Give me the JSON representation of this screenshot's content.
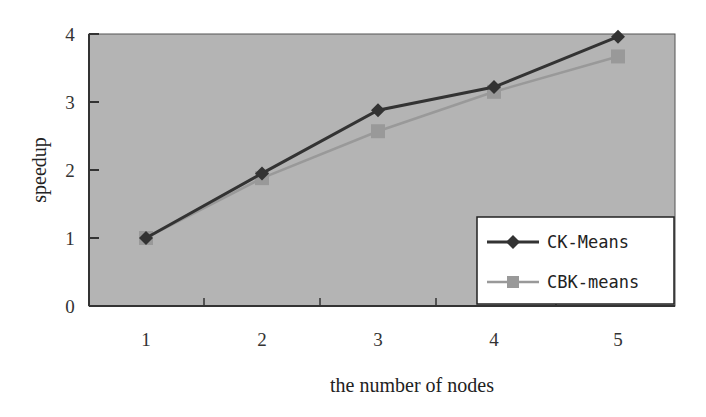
{
  "chart_data": {
    "type": "line",
    "title": "",
    "xlabel": "the number of nodes",
    "ylabel": "speedup",
    "categories": [
      "1",
      "2",
      "3",
      "4",
      "5"
    ],
    "x": [
      1,
      2,
      3,
      4,
      5
    ],
    "ylim": [
      0,
      4
    ],
    "yticks": [
      "0",
      "1",
      "2",
      "3",
      "4"
    ],
    "grid": false,
    "legend_position": "lower right inside",
    "series": [
      {
        "name": "CK-Means",
        "marker": "diamond",
        "color": "#333333",
        "values": [
          1.0,
          1.95,
          2.88,
          3.22,
          3.96
        ]
      },
      {
        "name": "CBK-means",
        "marker": "square",
        "color": "#8c8c8c",
        "values": [
          1.0,
          1.88,
          2.57,
          3.15,
          3.67
        ]
      }
    ]
  },
  "colors": {
    "plot_background": "#b4b4b4",
    "axis": "#333333"
  }
}
